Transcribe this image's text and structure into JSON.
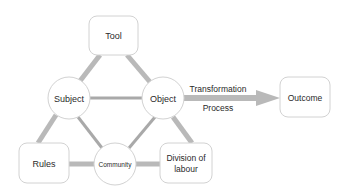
{
  "diagram": {
    "colors": {
      "thick_edge": "#b9b9b9",
      "thin_edge": "#a9a9a9",
      "node_border": "#d2d2d2",
      "text": "#2a2a2a"
    },
    "nodes": {
      "tool": {
        "label": "Tool",
        "shape": "rounded-box"
      },
      "subject": {
        "label": "Subject",
        "shape": "circle"
      },
      "object": {
        "label": "Object",
        "shape": "circle"
      },
      "outcome": {
        "label": "Outcome",
        "shape": "rounded-box"
      },
      "rules": {
        "label": "Rules",
        "shape": "rounded-box"
      },
      "community": {
        "label": "Community",
        "shape": "circle"
      },
      "division": {
        "label_line1": "Division of",
        "label_line2": "labour",
        "shape": "rounded-box"
      }
    },
    "arrow": {
      "from": "Object",
      "to": "Outcome",
      "label_top": "Transformation",
      "label_bottom": "Process"
    },
    "edges": [
      {
        "from": "Tool",
        "to": "Subject",
        "style": "thick"
      },
      {
        "from": "Tool",
        "to": "Object",
        "style": "thick"
      },
      {
        "from": "Subject",
        "to": "Object",
        "style": "thin"
      },
      {
        "from": "Subject",
        "to": "Rules",
        "style": "thick"
      },
      {
        "from": "Subject",
        "to": "Community",
        "style": "thin"
      },
      {
        "from": "Object",
        "to": "Community",
        "style": "thin"
      },
      {
        "from": "Object",
        "to": "Division of labour",
        "style": "thick"
      },
      {
        "from": "Rules",
        "to": "Community",
        "style": "thick"
      },
      {
        "from": "Community",
        "to": "Division of labour",
        "style": "thick"
      }
    ]
  }
}
